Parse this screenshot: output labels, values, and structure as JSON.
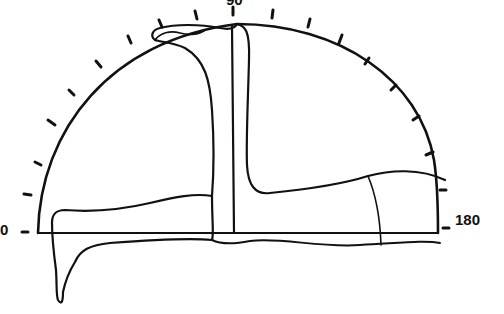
{
  "diagram": {
    "type": "semicircular polar plot (protractor scale, 0–180°)",
    "labels": {
      "left": "0",
      "right": "180",
      "top": "90"
    },
    "scale": {
      "start_deg": 0,
      "end_deg": 180,
      "tick_count": 19,
      "tick_interval_deg": 10
    },
    "colors": {
      "ink": "#111111",
      "background": "#ffffff"
    }
  }
}
